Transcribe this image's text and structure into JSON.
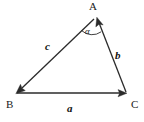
{
  "figure": {
    "kind": "vector-triangle-diagram",
    "background_color": "#ffffff",
    "stroke_color": "#2b2b2b",
    "text_color": "#1a1a1a",
    "width": 144,
    "height": 122
  },
  "vertices": [
    {
      "id": "A",
      "label": "A",
      "x": 96,
      "y": 16
    },
    {
      "id": "B",
      "label": "B",
      "x": 16,
      "y": 93
    },
    {
      "id": "C",
      "label": "C",
      "x": 127,
      "y": 93
    }
  ],
  "vectors": [
    {
      "id": "a",
      "label": "a",
      "from": "B",
      "to": "C",
      "arrow_at": "C",
      "label_x": 70,
      "label_y": 108
    },
    {
      "id": "b",
      "label": "b",
      "from": "C",
      "to": "A",
      "arrow_at": "A",
      "label_x": 118,
      "label_y": 55
    },
    {
      "id": "c",
      "label": "c",
      "from": "A",
      "to": "B",
      "arrow_at": "B",
      "label_x": 48,
      "label_y": 46
    }
  ],
  "angles": [
    {
      "id": "alpha",
      "label": "α",
      "at_vertex": "A",
      "between": [
        "c",
        "b"
      ],
      "label_x": 89,
      "label_y": 32
    }
  ]
}
